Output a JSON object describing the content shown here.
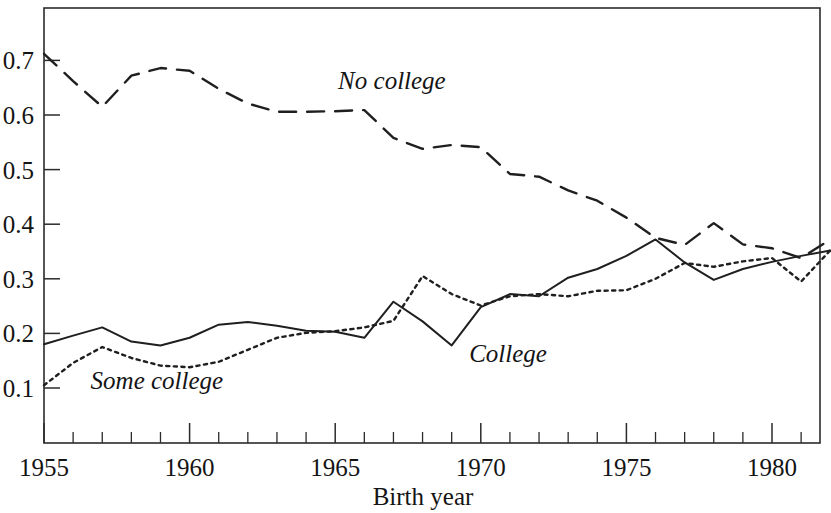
{
  "chart_data": {
    "type": "line",
    "title": "",
    "xlabel": "Birth year",
    "ylabel": "",
    "xlim": [
      1955,
      1982.2
    ],
    "ylim": [
      0.028,
      0.775
    ],
    "grid": false,
    "legend_position": "inline-annotations",
    "x_major_ticks": [
      1955,
      1960,
      1965,
      1970,
      1975,
      1980
    ],
    "x_tick_labels": [
      "1955",
      "1960",
      "1965",
      "1970",
      "1975",
      "1980"
    ],
    "x_minor_tick_step": 1,
    "y_ticks": [
      0.1,
      0.2,
      0.3,
      0.4,
      0.5,
      0.6,
      0.7
    ],
    "y_tick_labels": [
      "0.1",
      "0.2",
      "0.3",
      "0.4",
      "0.5",
      "0.6",
      "0.7"
    ],
    "x": [
      1955,
      1956,
      1957,
      1958,
      1959,
      1960,
      1961,
      1962,
      1963,
      1964,
      1965,
      1966,
      1967,
      1968,
      1969,
      1970,
      1971,
      1972,
      1973,
      1974,
      1975,
      1976,
      1977,
      1978,
      1979,
      1980,
      1981,
      1982
    ],
    "series": [
      {
        "name": "No college",
        "style": "dashed",
        "label_x": 1965.1,
        "label_y": 0.648,
        "values": [
          0.712,
          0.662,
          0.615,
          0.672,
          0.686,
          0.681,
          0.648,
          0.621,
          0.606,
          0.606,
          0.607,
          0.609,
          0.558,
          0.538,
          0.545,
          0.541,
          0.492,
          0.487,
          0.462,
          0.443,
          0.412,
          0.375,
          0.362,
          0.402,
          0.363,
          0.356,
          0.338,
          0.372
        ]
      },
      {
        "name": "College",
        "style": "solid",
        "label_x": 1969.6,
        "label_y": 0.148,
        "values": [
          0.18,
          0.196,
          0.211,
          0.185,
          0.178,
          0.192,
          0.216,
          0.221,
          0.214,
          0.205,
          0.203,
          0.192,
          0.258,
          0.222,
          0.178,
          0.248,
          0.272,
          0.268,
          0.302,
          0.318,
          0.342,
          0.372,
          0.33,
          0.298,
          0.318,
          0.331,
          0.342,
          0.352
        ]
      },
      {
        "name": "Some college",
        "style": "dotted",
        "label_x": 1956.6,
        "label_y": 0.098,
        "values": [
          0.105,
          0.146,
          0.175,
          0.155,
          0.141,
          0.138,
          0.148,
          0.17,
          0.192,
          0.201,
          0.204,
          0.211,
          0.223,
          0.305,
          0.272,
          0.251,
          0.268,
          0.272,
          0.268,
          0.278,
          0.279,
          0.3,
          0.329,
          0.322,
          0.332,
          0.338,
          0.295,
          0.352
        ]
      }
    ]
  }
}
